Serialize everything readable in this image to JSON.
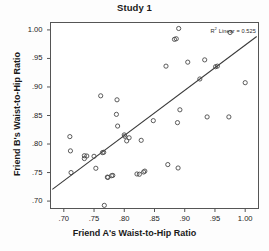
{
  "figure": {
    "title": "Study 1",
    "background_color": "#fdfdfd",
    "frame_color": "#555555",
    "point_color": "#4a4a4a",
    "line_color": "#3a3a3a"
  },
  "annotations": {
    "r2_prefix": "R",
    "r2_superscript": "2",
    "r2_text": " Linear = 0.525"
  },
  "chart_data": {
    "type": "scatter",
    "title": "Study 1",
    "xlabel": "Friend A's Waist-to-Hip Ratio",
    "ylabel": "Friend B's Waist-to-Hip Ratio",
    "xlim": [
      0.678,
      1.022
    ],
    "ylim": [
      0.687,
      1.013
    ],
    "xticks": [
      0.7,
      0.75,
      0.8,
      0.85,
      0.9,
      0.95,
      1.0
    ],
    "xticklabels": [
      ".70",
      ".75",
      ".80",
      ".85",
      ".90",
      ".95",
      "1.00"
    ],
    "yticks": [
      0.7,
      0.75,
      0.8,
      0.85,
      0.9,
      0.95,
      1.0
    ],
    "yticklabels": [
      ".70",
      ".75",
      ".80",
      ".85",
      ".90",
      ".95",
      "1.00"
    ],
    "grid": false,
    "legend": null,
    "r_squared": 0.525,
    "fit_line": {
      "type": "linear",
      "x_start": 0.681,
      "y_start": 0.7205,
      "x_end": 1.019,
      "y_end": 0.9885
    },
    "points": [
      [
        0.71,
        0.813
      ],
      [
        0.711,
        0.788
      ],
      [
        0.712,
        0.75
      ],
      [
        0.734,
        0.7795
      ],
      [
        0.734,
        0.7745
      ],
      [
        0.738,
        0.779
      ],
      [
        0.75,
        0.7785
      ],
      [
        0.753,
        0.7575
      ],
      [
        0.761,
        0.8845
      ],
      [
        0.764,
        0.785
      ],
      [
        0.766,
        0.7855
      ],
      [
        0.767,
        0.6925
      ],
      [
        0.772,
        0.742
      ],
      [
        0.773,
        0.7415
      ],
      [
        0.779,
        0.7445
      ],
      [
        0.781,
        0.745
      ],
      [
        0.787,
        0.852
      ],
      [
        0.788,
        0.8775
      ],
      [
        0.789,
        0.8315
      ],
      [
        0.8,
        0.816
      ],
      [
        0.801,
        0.8135
      ],
      [
        0.804,
        0.8055
      ],
      [
        0.808,
        0.811
      ],
      [
        0.821,
        0.7475
      ],
      [
        0.825,
        0.747
      ],
      [
        0.828,
        0.8065
      ],
      [
        0.832,
        0.751
      ],
      [
        0.834,
        0.7525
      ],
      [
        0.848,
        0.841
      ],
      [
        0.869,
        0.9365
      ],
      [
        0.872,
        0.764
      ],
      [
        0.883,
        0.9835
      ],
      [
        0.886,
        0.9845
      ],
      [
        0.888,
        0.8375
      ],
      [
        0.889,
        0.758
      ],
      [
        0.89,
        1.0025
      ],
      [
        0.892,
        0.86
      ],
      [
        0.905,
        0.9435
      ],
      [
        0.925,
        0.914
      ],
      [
        0.933,
        0.9475
      ],
      [
        0.937,
        0.8475
      ],
      [
        0.951,
        0.9355
      ],
      [
        0.954,
        0.9365
      ],
      [
        0.973,
        0.8475
      ],
      [
        0.975,
        0.9955
      ],
      [
        1.0,
        0.9075
      ]
    ]
  }
}
